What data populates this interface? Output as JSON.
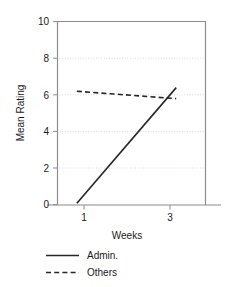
{
  "chart_data": {
    "type": "line",
    "title": "",
    "xlabel": "Weeks",
    "ylabel": "Mean Rating",
    "x": [
      1,
      3
    ],
    "xticks": [
      "1",
      "3"
    ],
    "xlim": [
      0.6,
      3.6
    ],
    "yticks": [
      "0",
      "2",
      "4",
      "6",
      "8",
      "10"
    ],
    "ytickvalues": [
      0,
      2,
      4,
      6,
      8,
      10
    ],
    "ylim": [
      0,
      10
    ],
    "grid": "horizontal-dotted",
    "legend_position": "below-left",
    "series": [
      {
        "name": "Admin.",
        "style": "solid",
        "color": "#262626",
        "values": [
          0.1,
          6.4
        ]
      },
      {
        "name": "Others",
        "style": "dashed",
        "color": "#262626",
        "values": [
          6.2,
          5.8
        ]
      }
    ]
  },
  "axes": {
    "y_title": "Mean Rating",
    "x_title": "Weeks",
    "y_tick_0": "0",
    "y_tick_1": "2",
    "y_tick_2": "4",
    "y_tick_3": "6",
    "y_tick_4": "8",
    "y_tick_5": "10",
    "x_tick_0": "1",
    "x_tick_1": "3"
  },
  "legend": {
    "entry_0_label": "Admin.",
    "entry_1_label": "Others"
  },
  "colors": {
    "line": "#262626",
    "grid": "#d9d9d9",
    "frame": "#8c8c8c",
    "background": "#ffffff"
  }
}
